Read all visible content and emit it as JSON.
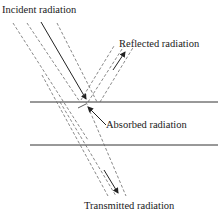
{
  "diagram": {
    "labels": {
      "incident": "Incident radiation",
      "reflected": "Reflected radiation",
      "absorbed": "Absorbed radiation",
      "transmitted": "Transmitted radiation"
    },
    "colors": {
      "line": "#333333",
      "dashed": "#6a6a6a",
      "text": "#1a1a1a",
      "background": "#ffffff"
    },
    "icons": {
      "incident_arrow": "arrow-down-right",
      "reflected_arrow": "arrow-up-right",
      "absorbed_arrow": "arrow-up-left",
      "transmitted_arrow": "arrow-down-right"
    }
  }
}
